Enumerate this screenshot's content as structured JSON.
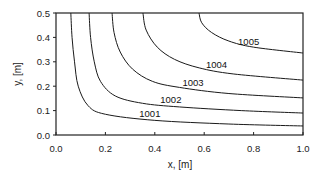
{
  "chart_data": {
    "type": "line",
    "subtype": "contour",
    "title": "",
    "xlabel": "x, [m]",
    "ylabel": "y, [m]",
    "xlim": [
      0.0,
      1.0
    ],
    "ylim": [
      0.0,
      0.5
    ],
    "xticks": [
      "0.0",
      "0.2",
      "0.4",
      "0.6",
      "0.8",
      "1.0"
    ],
    "yticks": [
      "0.0",
      "0.1",
      "0.2",
      "0.3",
      "0.4",
      "0.5"
    ],
    "grid": false,
    "legend": null,
    "series": [
      {
        "name": "1001",
        "label": "1001",
        "x_at_top": 0.06,
        "y_at_right": 0.037,
        "points": [
          [
            0.06,
            0.5
          ],
          [
            0.065,
            0.4
          ],
          [
            0.075,
            0.3
          ],
          [
            0.09,
            0.2
          ],
          [
            0.13,
            0.12
          ],
          [
            0.2,
            0.085
          ],
          [
            0.4,
            0.06
          ],
          [
            0.7,
            0.045
          ],
          [
            1.0,
            0.037
          ]
        ]
      },
      {
        "name": "1002",
        "label": "1002",
        "x_at_top": 0.134,
        "y_at_right": 0.09,
        "points": [
          [
            0.134,
            0.5
          ],
          [
            0.14,
            0.4
          ],
          [
            0.155,
            0.3
          ],
          [
            0.18,
            0.22
          ],
          [
            0.24,
            0.16
          ],
          [
            0.35,
            0.13
          ],
          [
            0.5,
            0.115
          ],
          [
            0.75,
            0.1
          ],
          [
            1.0,
            0.09
          ]
        ]
      },
      {
        "name": "1003",
        "label": "1003",
        "x_at_top": 0.227,
        "y_at_right": 0.152,
        "points": [
          [
            0.227,
            0.5
          ],
          [
            0.235,
            0.42
          ],
          [
            0.26,
            0.34
          ],
          [
            0.31,
            0.27
          ],
          [
            0.39,
            0.22
          ],
          [
            0.5,
            0.195
          ],
          [
            0.7,
            0.17
          ],
          [
            1.0,
            0.152
          ]
        ]
      },
      {
        "name": "1004",
        "label": "1004",
        "x_at_top": 0.352,
        "y_at_right": 0.225,
        "points": [
          [
            0.352,
            0.5
          ],
          [
            0.365,
            0.43
          ],
          [
            0.41,
            0.36
          ],
          [
            0.48,
            0.31
          ],
          [
            0.58,
            0.275
          ],
          [
            0.72,
            0.25
          ],
          [
            1.0,
            0.225
          ]
        ]
      },
      {
        "name": "1005",
        "label": "1005",
        "x_at_top": 0.579,
        "y_at_right": 0.336,
        "points": [
          [
            0.579,
            0.5
          ],
          [
            0.59,
            0.46
          ],
          [
            0.63,
            0.42
          ],
          [
            0.7,
            0.385
          ],
          [
            0.8,
            0.36
          ],
          [
            1.0,
            0.336
          ]
        ]
      }
    ],
    "annotations": [
      {
        "text": "1001",
        "x": 0.38,
        "y": 0.075
      },
      {
        "text": "1002",
        "x": 0.465,
        "y": 0.13
      },
      {
        "text": "1003",
        "x": 0.555,
        "y": 0.2
      },
      {
        "text": "1004",
        "x": 0.65,
        "y": 0.275
      },
      {
        "text": "1005",
        "x": 0.78,
        "y": 0.37
      }
    ]
  }
}
